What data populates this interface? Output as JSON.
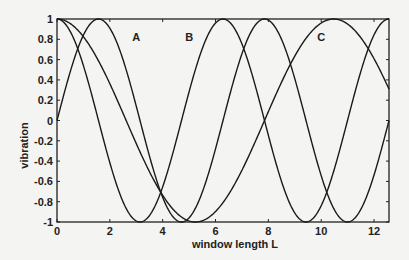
{
  "chart_data": {
    "type": "line",
    "title": "",
    "xlabel": "window length L",
    "ylabel": "vibration",
    "xlim": [
      0,
      12.566
    ],
    "ylim": [
      -1,
      1
    ],
    "x_ticks": [
      0,
      2,
      4,
      6,
      8,
      10,
      12
    ],
    "y_ticks": [
      1,
      0.8,
      0.6,
      0.4,
      0.2,
      0,
      -0.2,
      -0.4,
      -0.6,
      -0.8,
      -1
    ],
    "grid": false,
    "legend": "none",
    "annotations": [
      {
        "text": "A",
        "x": 3.0,
        "y": 0.82
      },
      {
        "text": "B",
        "x": 5.0,
        "y": 0.82
      },
      {
        "text": "C",
        "x": 10.0,
        "y": 0.82
      }
    ],
    "series": [
      {
        "name": "cos(L)",
        "formula": "cos(L)",
        "peaks": [
          0,
          6.28,
          12.57
        ],
        "troughs": [
          3.14,
          9.42
        ]
      },
      {
        "name": "sin(L)",
        "formula": "sin(L)",
        "peaks": [
          1.57,
          7.85
        ],
        "troughs": [
          4.71,
          10.99
        ]
      },
      {
        "name": "cos(0.6L)",
        "formula": "cos(0.6L)",
        "peaks": [
          0,
          10.47
        ],
        "troughs": [
          5.24
        ]
      }
    ]
  },
  "axes": {
    "xlabel": "window length L",
    "ylabel": "vibration"
  }
}
